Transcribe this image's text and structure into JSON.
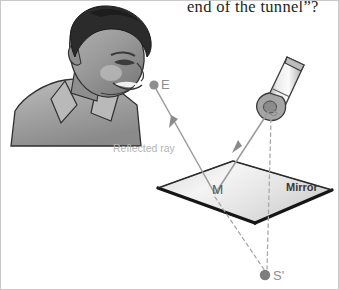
{
  "figure": {
    "caption": "end of the tunnel”?",
    "labels": {
      "eye_point": "E",
      "source_point": "S",
      "mirror_point": "M",
      "virtual_image_point": "S'",
      "reflected_ray": "Reflected ray",
      "mirror": "Mirror"
    },
    "colors": {
      "ray": "#9a9a9a",
      "dashed": "#a8a8a8",
      "mirror_fill_light": "#f2f2f2",
      "mirror_fill_dark": "#cfcfcf",
      "mirror_edge": "#1a1a1a",
      "label_gray": "#8d8d8d",
      "caption_text": "#231f20",
      "hair": "#2b2b2b",
      "skin": "#9c9c9c",
      "shirt": "#a3a3a3",
      "torch_body": "#d8d8d8"
    }
  }
}
